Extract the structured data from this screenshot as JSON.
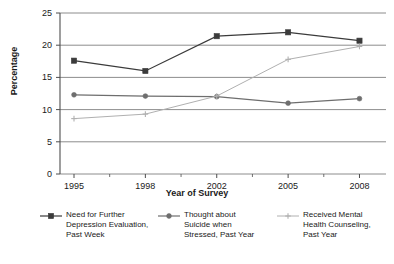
{
  "chart_data": {
    "type": "line",
    "title": "",
    "xlabel": "Year of Survey",
    "ylabel": "Percentage",
    "categories": [
      "1995",
      "1998",
      "2002",
      "2005",
      "2008"
    ],
    "x": [
      1995,
      1998,
      2002,
      2005,
      2008
    ],
    "ylim": [
      0,
      25
    ],
    "yticks": [
      0,
      5,
      10,
      15,
      20,
      25
    ],
    "grid": "horizontal",
    "legend_position": "bottom",
    "series": [
      {
        "name": "Need for Further Depression Evaluation, Past Week",
        "legend_label": "Need for Further\nDepression Evaluation,\nPast Week",
        "marker": "square",
        "color": "#3b3b3b",
        "values": [
          17.6,
          16.0,
          21.4,
          22.0,
          20.7
        ]
      },
      {
        "name": "Thought about Suicide when Stressed, Past Year",
        "legend_label": "Thought about\nSuicide when\nStressed, Past Year",
        "marker": "circle",
        "color": "#6e6e6e",
        "values": [
          12.3,
          12.1,
          12.0,
          11.0,
          11.7
        ]
      },
      {
        "name": "Received Mental Health Counseling, Past Year",
        "legend_label": "Received Mental\nHealth Counseling,\nPast Year",
        "marker": "cross",
        "color": "#b0b0b0",
        "values": [
          8.6,
          9.3,
          12.1,
          17.8,
          19.8
        ]
      }
    ]
  },
  "axes": {
    "ylabel": "Percentage",
    "xlabel": "Year of Survey",
    "yticks": [
      "25",
      "20",
      "15",
      "10",
      "5",
      "0"
    ],
    "xticks": [
      "1995",
      "1998",
      "2002",
      "2005",
      "2008"
    ]
  },
  "legend": {
    "items": [
      {
        "label": "Need for Further\nDepression Evaluation,\nPast Week",
        "marker": "square-marker",
        "color": "#3b3b3b"
      },
      {
        "label": "Thought about\nSuicide when\nStressed, Past Year",
        "marker": "circle-marker",
        "color": "#6e6e6e"
      },
      {
        "label": "Received Mental\nHealth Counseling,\nPast Year",
        "marker": "cross-marker",
        "color": "#b0b0b0"
      }
    ]
  },
  "colors": {
    "series1": "#3b3b3b",
    "series2": "#6e6e6e",
    "series3": "#b0b0b0",
    "grid": "#808080",
    "axis": "#4d4d4d",
    "background": "#ffffff"
  }
}
